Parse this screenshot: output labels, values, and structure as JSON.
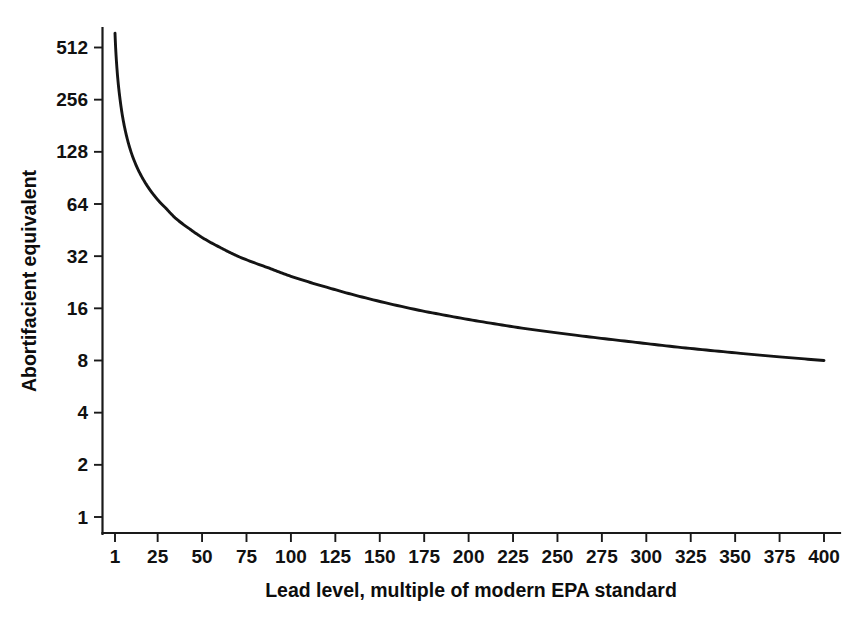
{
  "chart_data": {
    "type": "line",
    "title": "",
    "xlabel": "Lead level, multiple of modern EPA standard",
    "ylabel": "Abortifacient equivalent",
    "xlim": [
      1,
      400
    ],
    "ylim": [
      1,
      700
    ],
    "yscale": "log2",
    "xscale": "linear",
    "grid": false,
    "legend": false,
    "xticks": [
      1,
      25,
      50,
      75,
      100,
      125,
      150,
      175,
      200,
      225,
      250,
      275,
      300,
      325,
      350,
      375,
      400
    ],
    "xtick_labels": [
      "1",
      "25",
      "50",
      "75",
      "100",
      "125",
      "150",
      "175",
      "200",
      "225",
      "250",
      "275",
      "300",
      "325",
      "350",
      "375",
      "400"
    ],
    "yticks": [
      1,
      2,
      4,
      8,
      16,
      32,
      64,
      128,
      256,
      512
    ],
    "ytick_labels": [
      "1",
      "2",
      "4",
      "8",
      "16",
      "32",
      "64",
      "128",
      "256",
      "512"
    ],
    "series": [
      {
        "name": "Abortifacient equivalent vs lead level",
        "color": "#141414",
        "x": [
          1,
          2,
          3,
          4,
          5,
          7,
          10,
          14,
          18,
          22,
          26,
          30,
          35,
          43,
          50,
          60,
          70,
          87,
          100,
          120,
          140,
          172,
          200,
          230,
          260,
          290,
          320,
          353,
          375,
          400
        ],
        "y": [
          620,
          400,
          305,
          250,
          212,
          166,
          128,
          101,
          85,
          74,
          66,
          60,
          53,
          46,
          41,
          36,
          32,
          27.5,
          24.5,
          21.2,
          18.6,
          15.6,
          13.8,
          12.3,
          11.2,
          10.3,
          9.5,
          8.8,
          8.4,
          8.0
        ]
      }
    ],
    "series_display": {
      "note": "Rendered curve traces value = 620 / lead^0.9 style decay on log2 y-axis",
      "points": [
        {
          "lead": 1,
          "value": 620
        },
        {
          "lead": 25,
          "value": 68
        },
        {
          "lead": 43,
          "value": 16
        },
        {
          "lead": 87,
          "value": 8
        },
        {
          "lead": 172,
          "value": 4
        },
        {
          "lead": 353,
          "value": 2
        },
        {
          "lead": 400,
          "value": 1.65
        }
      ]
    }
  },
  "axis_colors": {
    "line": "#1a1a1a",
    "curve": "#141414",
    "text": "#111111",
    "background": "#ffffff"
  }
}
